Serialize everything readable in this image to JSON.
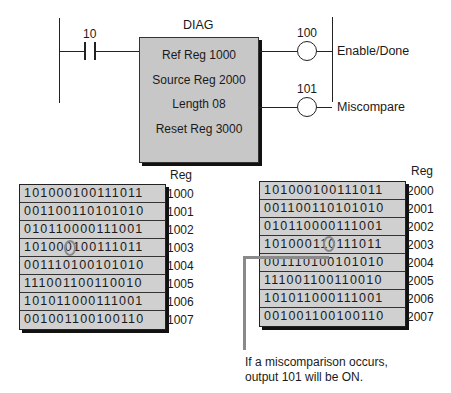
{
  "ladder": {
    "contact": {
      "address": "10"
    },
    "block": {
      "title": "DIAG",
      "params": [
        "Ref Reg  1000",
        "Source Reg  2000",
        "Length  08",
        "Reset Reg  3000"
      ]
    },
    "outputs": [
      {
        "address": "100",
        "label": "Enable/Done"
      },
      {
        "address": "101",
        "label": "Miscompare"
      }
    ]
  },
  "reference_table": {
    "header": "Reg",
    "rows": [
      {
        "bits": "101000100111011",
        "reg": "1000"
      },
      {
        "bits": "001100110101010",
        "reg": "1001"
      },
      {
        "bits": "010110000111001",
        "reg": "1002"
      },
      {
        "bits": "101000100111011",
        "reg": "1003",
        "highlight_index": 7,
        "highlight_value": "0"
      },
      {
        "bits": "001110100101010",
        "reg": "1004"
      },
      {
        "bits": "111001100110010",
        "reg": "1005"
      },
      {
        "bits": "101011000111001",
        "reg": "1006"
      },
      {
        "bits": "001001100100110",
        "reg": "1007"
      }
    ]
  },
  "source_table": {
    "header": "Reg",
    "rows": [
      {
        "bits": "101000100111011",
        "reg": "2000"
      },
      {
        "bits": "001100110101010",
        "reg": "2001"
      },
      {
        "bits": "010110000111001",
        "reg": "2002"
      },
      {
        "bits": "101000110111011",
        "reg": "2003",
        "highlight_index": 7,
        "highlight_value": "1"
      },
      {
        "bits": "001110100101010",
        "reg": "2004"
      },
      {
        "bits": "111001100110010",
        "reg": "2005"
      },
      {
        "bits": "101011000111001",
        "reg": "2006"
      },
      {
        "bits": "001001100100110",
        "reg": "2007"
      }
    ]
  },
  "caption": {
    "line1": "If a miscomparison occurs,",
    "line2": "output 101 will be ON."
  },
  "colors": {
    "block_fill": "#c7c7c7",
    "table_fill": "#d0d0d0",
    "highlight_ring": "#8a8a8a"
  }
}
